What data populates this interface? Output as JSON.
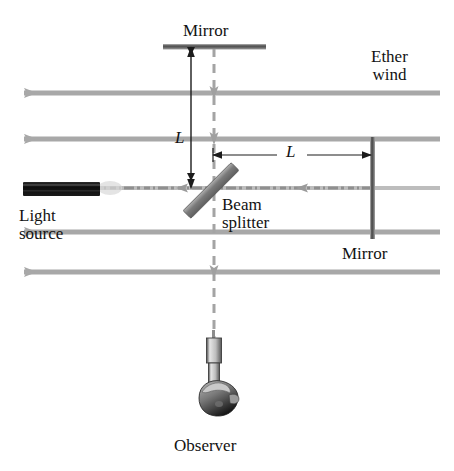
{
  "figure": {
    "background_color": "#ffffff",
    "text_color": "#121212",
    "ether_arrow_color": "#a8a8a8",
    "beam_color": "#9a9a9a",
    "dashed_beam_color": "#a0a0a0",
    "mirror_color": "#4a4a4a",
    "beam_splitter_color": "#808080",
    "source_color": "#111111"
  },
  "labels": {
    "mirror_top": "Mirror",
    "ether_wind_line1": "Ether",
    "ether_wind_line2": "wind",
    "length_vertical": "L",
    "length_horizontal": "L",
    "light_source_line1": "Light",
    "light_source_line2": "source",
    "beam_splitter_line1": "Beam",
    "beam_splitter_line2": "splitter",
    "mirror_right": "Mirror",
    "observer": "Observer"
  },
  "components": {
    "top_mirror": {
      "name": "Mirror",
      "orientation": "horizontal",
      "x1": 163,
      "x2": 266,
      "y": 46
    },
    "right_mirror": {
      "name": "Mirror",
      "orientation": "vertical",
      "x": 372,
      "y1": 137,
      "y2": 239
    },
    "beam_splitter": {
      "name": "Beam splitter",
      "angle_deg": 45,
      "x1": 192,
      "y1": 214,
      "x2": 238,
      "y2": 167
    },
    "light_source": {
      "name": "Light source",
      "x1": 23,
      "x2": 100,
      "y1": 183,
      "y2": 196
    },
    "observer_telescope": {
      "name": "Observer",
      "x": 214,
      "y_top": 338,
      "y_bottom": 392
    },
    "observer_head": {
      "cx": 218,
      "cy": 402,
      "rx": 20,
      "ry": 16
    }
  },
  "ether_wind_arrows": {
    "direction": "left",
    "x_start": 440,
    "x_tip": 12,
    "y_values": [
      93,
      139,
      188,
      232,
      272
    ]
  },
  "beam_paths": {
    "horizontal_beam": {
      "y": 188,
      "x1": 100,
      "x2": 372
    },
    "vertical_beam_dashed": {
      "x": 214,
      "y1": 48,
      "y2": 338
    }
  },
  "dimensions": {
    "vertical": {
      "label": "L",
      "x": 191,
      "y_top": 48,
      "y_bottom": 188
    },
    "horizontal": {
      "label": "L",
      "y": 155,
      "x_left": 213,
      "x_right": 371
    }
  }
}
